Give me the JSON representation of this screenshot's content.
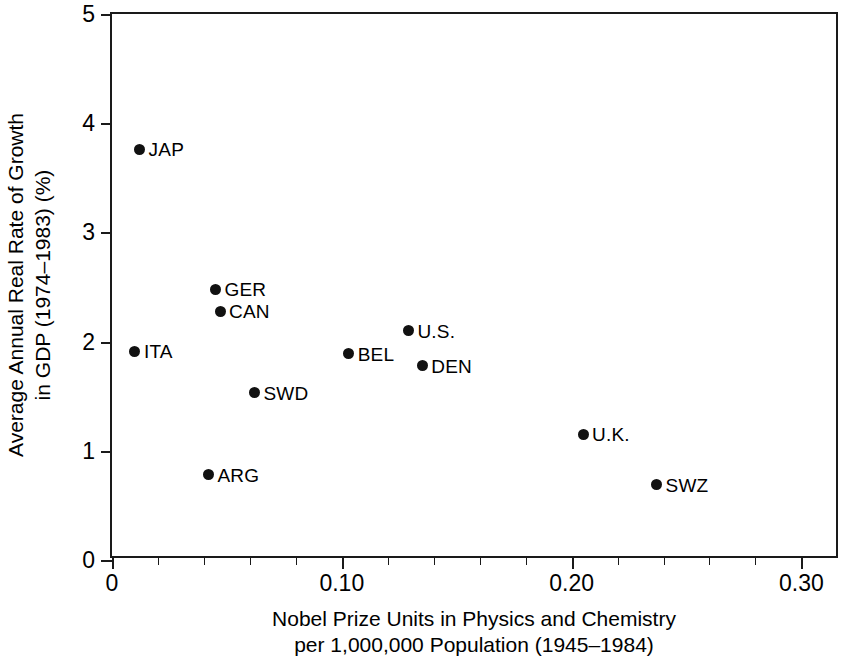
{
  "chart_data": {
    "type": "scatter",
    "title": "",
    "xlabel": "Nobel Prize Units in Physics and Chemistry per 1,000,000 Population (1945–1984)",
    "ylabel": "Average Annual Real Rate of Growth in GDP (1974–1983) (%)",
    "xlim": [
      0,
      0.3168
    ],
    "ylim": [
      0,
      5
    ],
    "grid": false,
    "legend": null,
    "xtick_labels": [
      "0",
      "0.10",
      "0.20",
      "0.30"
    ],
    "xtick_values": [
      0,
      0.1,
      0.2,
      0.3
    ],
    "xminor_step": 0.02,
    "ytick_labels": [
      "0",
      "1",
      "2",
      "3",
      "4",
      "5"
    ],
    "ytick_values": [
      0,
      1,
      2,
      3,
      4,
      5
    ],
    "points": [
      {
        "label": "JAP",
        "x": 0.012,
        "y": 3.76,
        "label_side": "right"
      },
      {
        "label": "GER",
        "x": 0.045,
        "y": 2.48,
        "label_side": "right"
      },
      {
        "label": "CAN",
        "x": 0.047,
        "y": 2.28,
        "label_side": "right"
      },
      {
        "label": "U.S.",
        "x": 0.129,
        "y": 2.1,
        "label_side": "right"
      },
      {
        "label": "ITA",
        "x": 0.01,
        "y": 1.91,
        "label_side": "right"
      },
      {
        "label": "BEL",
        "x": 0.103,
        "y": 1.89,
        "label_side": "right"
      },
      {
        "label": "DEN",
        "x": 0.135,
        "y": 1.78,
        "label_side": "right"
      },
      {
        "label": "SWD",
        "x": 0.062,
        "y": 1.53,
        "label_side": "right"
      },
      {
        "label": "U.K.",
        "x": 0.205,
        "y": 1.15,
        "label_side": "right"
      },
      {
        "label": "ARG",
        "x": 0.042,
        "y": 0.78,
        "label_side": "right"
      },
      {
        "label": "SWZ",
        "x": 0.237,
        "y": 0.69,
        "label_side": "right"
      }
    ]
  },
  "axis_titles": {
    "y_line1": "Average Annual Real Rate of Growth",
    "y_line2": "in GDP (1974–1983) (%)",
    "x_line1": "Nobel Prize Units in Physics and Chemistry",
    "x_line2": "per 1,000,000 Population (1945–1984)"
  },
  "colors": {
    "marker": "#111111",
    "axis": "#1a1a1a",
    "background": "#ffffff",
    "text": "#000000"
  }
}
